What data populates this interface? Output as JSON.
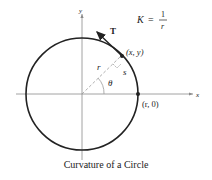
{
  "figure": {
    "caption": "Curvature of a Circle",
    "formula": {
      "lhs": "K",
      "eq": "=",
      "numerator": "1",
      "denominator": "r"
    },
    "axes": {
      "x_label": "x",
      "y_label": "y"
    },
    "labels": {
      "tangent": "T",
      "point": "(x, y)",
      "intercept": "(r, 0)",
      "radius": "r",
      "arc": "s",
      "angle": "θ"
    },
    "colors": {
      "circle": "#222222",
      "axes": "#8a8a8a",
      "dashed": "#9a9a9a",
      "text": "#222222"
    }
  }
}
